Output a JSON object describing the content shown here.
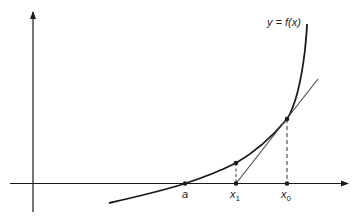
{
  "diagram": {
    "curve_label": "y = f(x)",
    "labels": {
      "root": "a",
      "x1_base": "x",
      "x1_sub": "1",
      "x0_base": "x",
      "x0_sub": "0"
    },
    "colors": {
      "stroke": "#1a1a1a",
      "tangent": "#444444",
      "background": "#ffffff"
    },
    "points": [
      {
        "name": "a",
        "on": "x-axis"
      },
      {
        "name": "x1",
        "on": "x-axis"
      },
      {
        "name": "f(x1)",
        "on": "curve"
      },
      {
        "name": "x0",
        "on": "x-axis"
      },
      {
        "name": "f(x0)",
        "on": "curve"
      }
    ]
  }
}
